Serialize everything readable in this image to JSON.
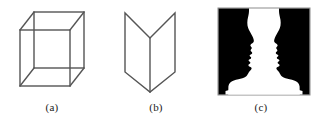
{
  "page": {
    "background_color": "#ffffff",
    "width": 314,
    "height": 131
  },
  "figure_panel": {
    "name": "ambiguous-figures-panel",
    "stroke_color": "#555555",
    "fill_color": "#000000",
    "caption_color": "#1a1a1a",
    "figures": [
      {
        "id": "a",
        "caption": "(a)",
        "name": "necker-cube",
        "type": "line-drawing",
        "stroke_color": "#555555",
        "stroke_width": 1.4,
        "geometry": {
          "front_face": [
            [
              20,
              30
            ],
            [
              70,
              30
            ],
            [
              70,
              86
            ],
            [
              20,
              86
            ]
          ],
          "back_face": [
            [
              34,
              12
            ],
            [
              84,
              12
            ],
            [
              84,
              68
            ],
            [
              34,
              68
            ]
          ],
          "connectors": [
            [
              [
                20,
                30
              ],
              [
                34,
                12
              ]
            ],
            [
              [
                70,
                30
              ],
              [
                84,
                12
              ]
            ],
            [
              [
                70,
                86
              ],
              [
                84,
                68
              ]
            ],
            [
              [
                20,
                86
              ],
              [
                34,
                68
              ]
            ]
          ]
        }
      },
      {
        "id": "b",
        "caption": "(b)",
        "name": "folded-card-figure",
        "type": "line-drawing",
        "stroke_color": "#555555",
        "stroke_width": 1.4,
        "geometry": {
          "outline": [
            [
              21,
              13
            ],
            [
              21,
              72
            ],
            [
              46,
              92
            ],
            [
              71,
              72
            ],
            [
              71,
              13
            ],
            [
              46,
              38
            ]
          ],
          "center_fold": [
            [
              46,
              38
            ],
            [
              46,
              92
            ]
          ]
        }
      },
      {
        "id": "c",
        "caption": "(c)",
        "name": "rubin-vase-faces",
        "type": "silhouette",
        "fill_color": "#000000",
        "background_color": "#ffffff",
        "border_color": "#8c8c8c",
        "geometry": {
          "frame": {
            "x": 10,
            "y": 8,
            "width": 92,
            "height": 87
          },
          "vase_waist_x": 56,
          "description": "two facing profile silhouettes forming a vase in negative space"
        }
      }
    ]
  }
}
